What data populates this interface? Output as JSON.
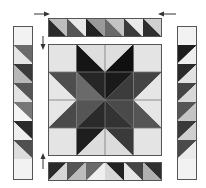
{
  "diagram": {
    "colors": {
      "light": "#e6e6e6",
      "pale": "#c8c8c8",
      "mid": "#8a8a8a",
      "midDark": "#6e6e6e",
      "dark": "#4a4a4a",
      "black": "#1a1a1a",
      "outline": "#555555",
      "arrow": "#333333"
    },
    "center_block": {
      "grid": "4x4",
      "description": "Eight-pointed star in dark shades on light background"
    },
    "top_border": {
      "units": 6,
      "description": "Half-square triangle strip, dark bottom-left triangles"
    },
    "bottom_border": {
      "units": 6,
      "description": "Half-square triangle strip, light bottom triangles"
    },
    "left_border": {
      "units": 8,
      "description": "Corner squares with 6 half-square triangles"
    },
    "right_border": {
      "units": 8,
      "description": "Corner squares with 6 half-square triangles"
    },
    "arrows": [
      {
        "name": "top-left-arrow",
        "direction": "right"
      },
      {
        "name": "top-right-arrow",
        "direction": "left"
      },
      {
        "name": "upper-left-arrow",
        "direction": "down"
      },
      {
        "name": "lower-left-arrow",
        "direction": "up"
      }
    ]
  }
}
